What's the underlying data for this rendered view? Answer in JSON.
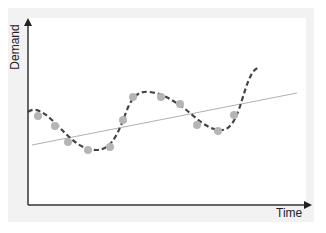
{
  "chart_data": {
    "type": "scatter",
    "title": "",
    "xlabel": "Time",
    "ylabel": "Demand",
    "grid": false,
    "legend": null,
    "axis_ticks": "none",
    "series": [
      {
        "name": "observed-demand",
        "kind": "scatter",
        "color": "#b5b5b5",
        "points_px": [
          [
            38,
            116
          ],
          [
            55,
            126
          ],
          [
            68,
            142
          ],
          [
            88,
            150
          ],
          [
            110,
            147
          ],
          [
            123,
            120
          ],
          [
            133,
            97
          ],
          [
            161,
            97
          ],
          [
            180,
            104
          ],
          [
            197,
            125
          ],
          [
            218,
            131
          ],
          [
            234,
            115
          ]
        ],
        "points_relative": [
          [
            0.04,
            0.47
          ],
          [
            0.1,
            0.42
          ],
          [
            0.14,
            0.33
          ],
          [
            0.21,
            0.29
          ],
          [
            0.29,
            0.31
          ],
          [
            0.34,
            0.45
          ],
          [
            0.38,
            0.58
          ],
          [
            0.48,
            0.58
          ],
          [
            0.55,
            0.54
          ],
          [
            0.61,
            0.43
          ],
          [
            0.68,
            0.4
          ],
          [
            0.74,
            0.48
          ]
        ]
      },
      {
        "name": "fitted-curve",
        "kind": "line",
        "style": "dashed",
        "color": "#444444",
        "path_px": "M28,112 C38,104 52,120 62,130 C72,140 82,150 96,150 C110,150 116,138 124,118 C130,100 136,90 150,92 C164,94 172,100 184,108 C196,118 206,128 218,130 C230,132 236,120 242,100 C248,80 252,70 258,68"
      },
      {
        "name": "linear-trend",
        "kind": "line",
        "style": "solid",
        "color": "#b0b0b0",
        "from_px": [
          32,
          145
        ],
        "to_px": [
          297,
          93
        ]
      }
    ]
  },
  "labels": {
    "y_axis": "Demand",
    "x_axis": "Time"
  },
  "colors": {
    "axis": "#333333",
    "points": "#b5b5b5",
    "curve": "#444444",
    "trend": "#b0b0b0",
    "panel": "#f2f2f2"
  }
}
